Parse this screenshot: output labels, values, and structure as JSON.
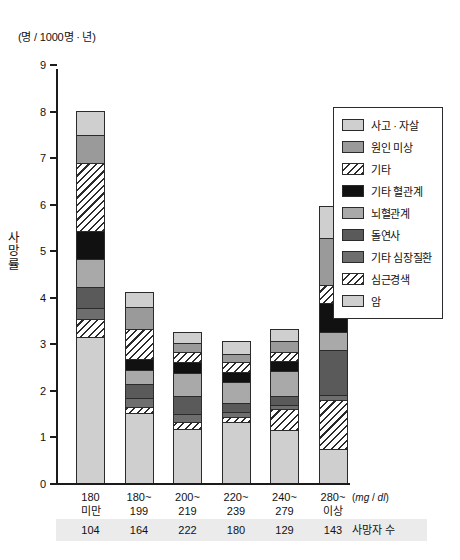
{
  "chart_data": {
    "type": "bar",
    "subtype": "stacked",
    "title": "",
    "unit_note": "(명 / 1000명 · 년)",
    "ylabel": "사망률",
    "xlabel_unit": "(mg / dl)",
    "ylim": [
      0,
      9
    ],
    "yticks": [
      0,
      1,
      2,
      3,
      4,
      5,
      6,
      7,
      8,
      9
    ],
    "ytick_labels": [
      "0",
      "1",
      "2",
      "3",
      "4",
      "5",
      "6",
      "7",
      "8",
      "9"
    ],
    "grid": false,
    "legend_position": "right",
    "categories": [
      "180\n미만",
      "180~\n199",
      "200~\n219",
      "220~\n239",
      "240~\n279",
      "280~\n이상"
    ],
    "category_lines": [
      [
        "180",
        "미만"
      ],
      [
        "180~",
        "199"
      ],
      [
        "200~",
        "219"
      ],
      [
        "220~",
        "239"
      ],
      [
        "240~",
        "279"
      ],
      [
        "280~",
        "이상"
      ]
    ],
    "series": [
      {
        "name": "암",
        "fill": "light",
        "values": [
          3.12,
          1.5,
          1.15,
          1.3,
          1.12,
          0.72
        ]
      },
      {
        "name": "심근경색",
        "fill": "hatch",
        "values": [
          0.4,
          0.12,
          0.14,
          0.1,
          0.45,
          1.05
        ]
      },
      {
        "name": "기타 심장질환",
        "fill": "dark",
        "values": [
          0.23,
          0.2,
          0.18,
          0.12,
          0.1,
          0.1
        ]
      },
      {
        "name": "돌연사",
        "fill": "darker",
        "values": [
          0.45,
          0.3,
          0.38,
          0.2,
          0.18,
          0.98
        ]
      },
      {
        "name": "뇌혈관계",
        "fill": "gray",
        "values": [
          0.6,
          0.3,
          0.5,
          0.45,
          0.55,
          0.38
        ]
      },
      {
        "name": "기타 혈관계",
        "fill": "black",
        "values": [
          0.6,
          0.23,
          0.25,
          0.22,
          0.22,
          0.62
        ]
      },
      {
        "name": "기타",
        "fill": "hatch",
        "values": [
          1.48,
          0.65,
          0.22,
          0.2,
          0.2,
          0.4
        ]
      },
      {
        "name": "원인 미상",
        "fill": "midgray",
        "values": [
          0.6,
          0.48,
          0.18,
          0.18,
          0.22,
          1.0
        ]
      },
      {
        "name": "사고 · 자살",
        "fill": "light",
        "values": [
          0.52,
          0.32,
          0.25,
          0.28,
          0.26,
          0.7
        ]
      }
    ],
    "totals": [
      8.0,
      4.1,
      3.25,
      3.05,
      3.3,
      5.95
    ],
    "legend_order_top_down": [
      {
        "label": "사고 · 자살",
        "fill": "light"
      },
      {
        "label": "원인 미상",
        "fill": "midgray"
      },
      {
        "label": "기타",
        "fill": "hatch"
      },
      {
        "label": "기타 혈관계",
        "fill": "black"
      },
      {
        "label": "뇌혈관계",
        "fill": "gray"
      },
      {
        "label": "돌연사",
        "fill": "darker"
      },
      {
        "label": "기타 심장질환",
        "fill": "dark"
      },
      {
        "label": "심근경색",
        "fill": "hatch"
      },
      {
        "label": "암",
        "fill": "light"
      }
    ],
    "footer": {
      "title": "사망자 수",
      "values": [
        "104",
        "164",
        "222",
        "180",
        "129",
        "143"
      ]
    },
    "colors": {
      "light": "#cfcfcf",
      "midgray": "#9a9a9a",
      "gray": "#a9a9a9",
      "dark": "#6e6e6e",
      "darker": "#5a5a5a",
      "black": "#111111",
      "hatch_line": "#2b2b2b",
      "axis": "#1b1b1b",
      "strip_bg": "#ebebeb"
    }
  }
}
